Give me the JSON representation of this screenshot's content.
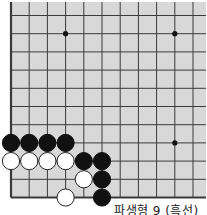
{
  "board": {
    "description": "Go board corner (lower-left) diagram",
    "columns": 11,
    "rows": 11,
    "background_color": "#d8d8d8",
    "line_color": "#3a3a3a",
    "star_points": [
      [
        3,
        1
      ],
      [
        9,
        1
      ],
      [
        9,
        7
      ]
    ],
    "stones": [
      {
        "color": "black",
        "col": 0,
        "row": 7
      },
      {
        "color": "black",
        "col": 1,
        "row": 7
      },
      {
        "color": "black",
        "col": 2,
        "row": 7
      },
      {
        "color": "black",
        "col": 3,
        "row": 7
      },
      {
        "color": "white",
        "col": 0,
        "row": 8
      },
      {
        "color": "white",
        "col": 1,
        "row": 8
      },
      {
        "color": "white",
        "col": 2,
        "row": 8
      },
      {
        "color": "white",
        "col": 3,
        "row": 8
      },
      {
        "color": "black",
        "col": 4,
        "row": 8
      },
      {
        "color": "black",
        "col": 5,
        "row": 8
      },
      {
        "color": "white",
        "col": 4,
        "row": 9
      },
      {
        "color": "black",
        "col": 5,
        "row": 9
      },
      {
        "color": "white",
        "col": 3,
        "row": 10
      },
      {
        "color": "black",
        "col": 5,
        "row": 10
      }
    ]
  },
  "caption": "파생형 9 (흑선)"
}
